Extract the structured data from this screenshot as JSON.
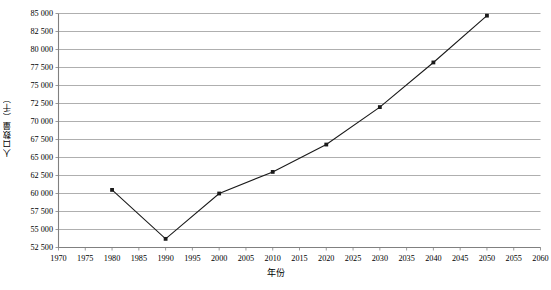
{
  "chart_data": {
    "type": "line",
    "title": "",
    "xlabel": "年份",
    "ylabel": "人口数量（千）",
    "x": [
      1980,
      1990,
      2000,
      2010,
      2020,
      2030,
      2040,
      2050
    ],
    "values": [
      60500,
      53700,
      60000,
      63000,
      66800,
      72000,
      78200,
      84700
    ],
    "series": [
      {
        "name": "人口数量",
        "x": [
          1980,
          1990,
          2000,
          2010,
          2020,
          2030,
          2040,
          2050
        ],
        "values": [
          60500,
          53700,
          60000,
          63000,
          66800,
          72000,
          78200,
          84700
        ]
      }
    ],
    "xlim": [
      1970,
      2060
    ],
    "ylim": [
      52500,
      85000
    ],
    "xticks": [
      1970,
      1975,
      1980,
      1985,
      1990,
      1995,
      2000,
      2005,
      2010,
      2015,
      2020,
      2025,
      2030,
      2035,
      2040,
      2045,
      2050,
      2055,
      2060
    ],
    "xtick_labels": [
      "1970",
      "1975",
      "1980",
      "1985",
      "1990",
      "1995",
      "2000",
      "2005",
      "2010",
      "2015",
      "2020",
      "2025",
      "2030",
      "2035",
      "2040",
      "2045",
      "2050",
      "2055",
      "2060"
    ],
    "yticks": [
      52500,
      55000,
      57500,
      60000,
      62500,
      65000,
      67500,
      70000,
      72500,
      75000,
      77500,
      80000,
      82500,
      85000
    ],
    "ytick_labels": [
      "52 500",
      "55 000",
      "57 500",
      "60 000",
      "62 500",
      "65 000",
      "67 500",
      "70 000",
      "72 500",
      "75 000",
      "77 500",
      "80 000",
      "82 500",
      "85 000"
    ],
    "grid": {
      "horizontal": true,
      "vertical": false,
      "color": "#9a9a9a"
    },
    "legend": {
      "visible": false,
      "position": "none"
    },
    "line_color": "#1a1a1a",
    "marker": "square",
    "marker_color": "#1a1a1a",
    "axis_color": "#808080",
    "background": "#ffffff"
  }
}
